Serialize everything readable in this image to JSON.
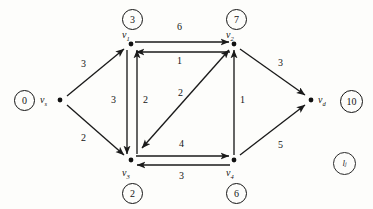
{
  "diagram": {
    "type": "directed-weighted-graph",
    "nodes": [
      {
        "id": "vs",
        "name": "v",
        "sub": "s",
        "label_value": "0",
        "x": 60,
        "y": 100,
        "label_pos": "left"
      },
      {
        "id": "v1",
        "name": "v",
        "sub": "1",
        "label_value": "3",
        "x": 131,
        "y": 44,
        "label_pos": "above"
      },
      {
        "id": "v2",
        "name": "v",
        "sub": "2",
        "label_value": "7",
        "x": 234,
        "y": 44,
        "label_pos": "above"
      },
      {
        "id": "v3",
        "name": "v",
        "sub": "3",
        "label_value": "2",
        "x": 131,
        "y": 160,
        "label_pos": "below"
      },
      {
        "id": "v4",
        "name": "v",
        "sub": "4",
        "label_value": "6",
        "x": 234,
        "y": 160,
        "label_pos": "below"
      },
      {
        "id": "vd",
        "name": "v",
        "sub": "d",
        "label_value": "10",
        "x": 311,
        "y": 100,
        "label_pos": "right"
      }
    ],
    "edges": [
      {
        "from": "vs",
        "to": "v1",
        "weight": "3",
        "wx": 84,
        "wy": 66
      },
      {
        "from": "vs",
        "to": "v3",
        "weight": "2",
        "wx": 84,
        "wy": 139
      },
      {
        "from": "v1",
        "to": "v2",
        "weight": "6",
        "wx": 179,
        "wy": 30
      },
      {
        "from": "v2",
        "to": "v1",
        "weight": "1",
        "wx": 179,
        "wy": 61
      },
      {
        "from": "v1",
        "to": "v3",
        "weight": "3",
        "wx": 117,
        "wy": 100
      },
      {
        "from": "v3",
        "to": "v1",
        "weight": "2",
        "wx": 143,
        "wy": 100
      },
      {
        "from": "v2",
        "to": "v3",
        "weight": "2",
        "wx": 178,
        "wy": 93
      },
      {
        "from": "v3",
        "to": "v4",
        "weight": "4",
        "wx": 179,
        "wy": 145
      },
      {
        "from": "v4",
        "to": "v3",
        "weight": "3",
        "wx": 179,
        "wy": 176
      },
      {
        "from": "v4",
        "to": "v2",
        "weight": "1",
        "wx": 240,
        "wy": 100
      },
      {
        "from": "v2",
        "to": "vd",
        "weight": "3",
        "wx": 276,
        "wy": 66
      },
      {
        "from": "v4",
        "to": "vd",
        "weight": "5",
        "wx": 276,
        "wy": 139
      }
    ],
    "legend": {
      "name": "l",
      "sub": "j"
    },
    "colors": {
      "ink": "#141414",
      "paper": "#fdfdfb"
    }
  }
}
